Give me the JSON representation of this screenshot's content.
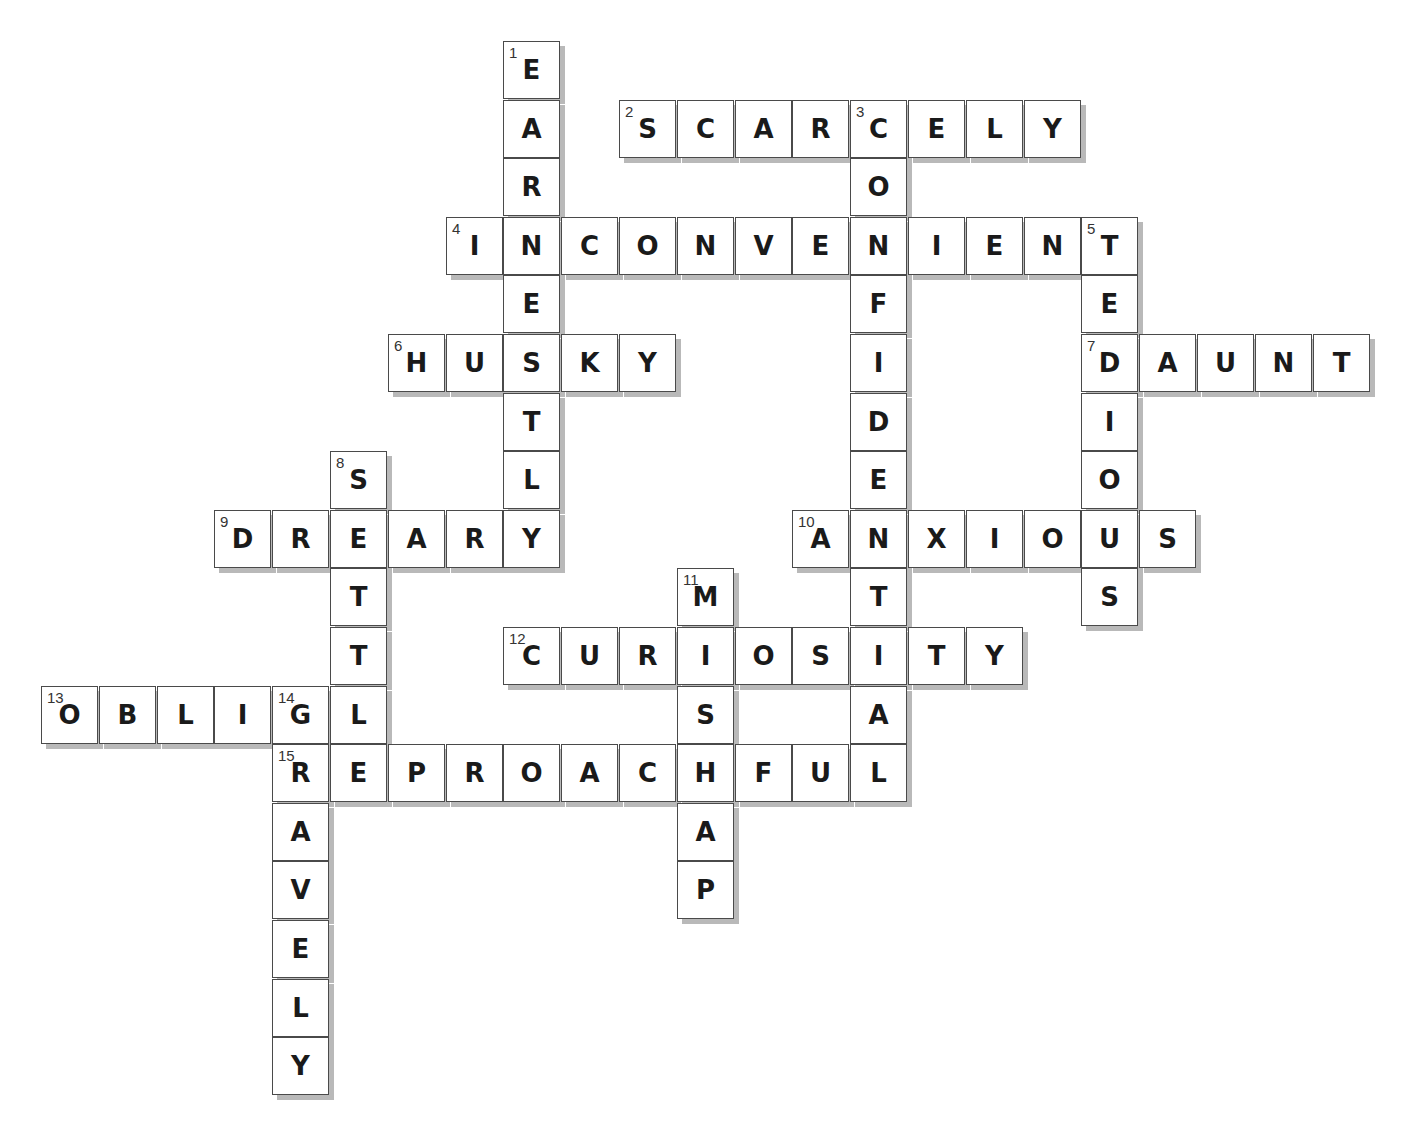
{
  "puzzle": {
    "grid": {
      "origin_x": 41,
      "origin_y": 41,
      "cell_w": 57.8,
      "cell_h": 58.6
    },
    "words": [
      {
        "number": 1,
        "direction": "down",
        "answer": "EARNESTLY",
        "row": 0,
        "col": 8
      },
      {
        "number": 2,
        "direction": "across",
        "answer": "SCARCELY",
        "row": 1,
        "col": 10
      },
      {
        "number": 3,
        "direction": "down",
        "answer": "CONFIDENTIAL",
        "row": 1,
        "col": 14
      },
      {
        "number": 4,
        "direction": "across",
        "answer": "INCONVENIENT",
        "row": 3,
        "col": 7
      },
      {
        "number": 5,
        "direction": "down",
        "answer": "TEDIOUS",
        "row": 3,
        "col": 18
      },
      {
        "number": 6,
        "direction": "across",
        "answer": "HUSKY",
        "row": 5,
        "col": 6
      },
      {
        "number": 7,
        "direction": "across",
        "answer": "DAUNT",
        "row": 5,
        "col": 18
      },
      {
        "number": 8,
        "direction": "down",
        "answer": "SETTLE",
        "row": 7,
        "col": 5
      },
      {
        "number": 9,
        "direction": "across",
        "answer": "DREARY",
        "row": 8,
        "col": 3
      },
      {
        "number": 10,
        "direction": "across",
        "answer": "ANXIOUS",
        "row": 8,
        "col": 13
      },
      {
        "number": 11,
        "direction": "down",
        "answer": "MISHAP",
        "row": 9,
        "col": 11
      },
      {
        "number": 12,
        "direction": "across",
        "answer": "CURIOSITY",
        "row": 10,
        "col": 8
      },
      {
        "number": 13,
        "direction": "across",
        "answer": "OBLIGE",
        "row": 11,
        "col": 0
      },
      {
        "number": 14,
        "direction": "down",
        "answer": "GRAVELY",
        "row": 11,
        "col": 4
      },
      {
        "number": 15,
        "direction": "across",
        "answer": "REPROACHFUL",
        "row": 12,
        "col": 4
      }
    ]
  }
}
